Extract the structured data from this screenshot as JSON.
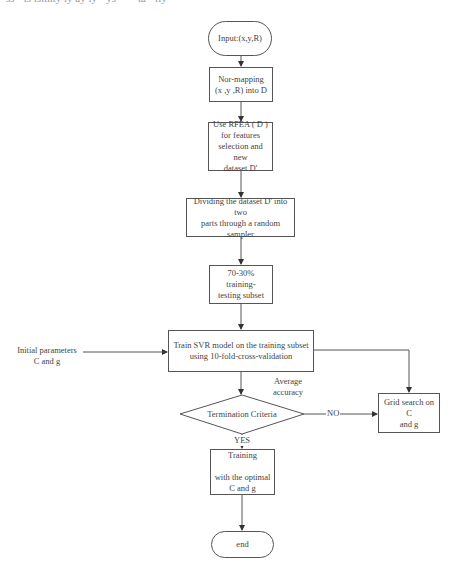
{
  "cutoff_text": "ss · ls  lsmlty ly ay ly · ys · · · ta · lly",
  "nodes": {
    "input": "Input:(x,y,R)",
    "nor_mapping": "Nor-mapping\n(x ,y ,R) into D",
    "rfea": "Use RFEA ( D )\nfor features\nselection and new\ndataset D'",
    "dividing": "Dividing the dataset D' into two\nparts through a random sampler",
    "split": "70-30% training-\ntesting subset",
    "train_svr": "Train SVR model on the training subset\nusing 10-fold-cross-validation",
    "termination": "Termination Criteria",
    "grid_search": "Grid search on C\nand g",
    "training_optimal": "Training\n\nwith the optimal\nC and g",
    "end": "end"
  },
  "labels": {
    "initial_params": "Initial parameters\nC and g",
    "average_accuracy": "Average\naccuracy",
    "no": "NO",
    "yes": "YES"
  },
  "colors": {
    "stroke": "#555555",
    "text": "#444444",
    "background": "#ffffff"
  }
}
